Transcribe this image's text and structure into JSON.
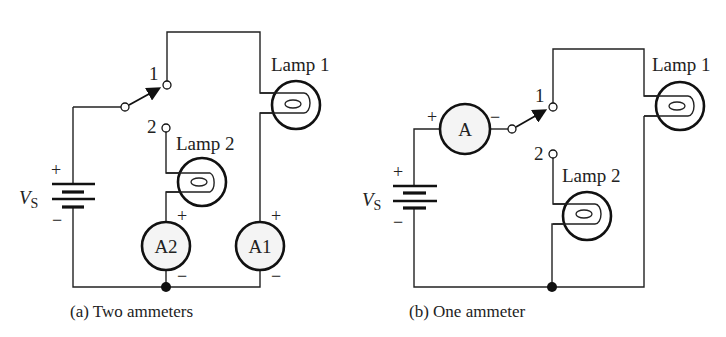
{
  "figures": [
    {
      "id": "a",
      "caption": "(a) Two ammeters",
      "source_label": "V",
      "source_sub": "S",
      "source_plus": "+",
      "source_minus": "−",
      "switch_pos1": "1",
      "switch_pos2": "2",
      "lamp1": "Lamp 1",
      "lamp2": "Lamp 2",
      "ammeter1": "A1",
      "ammeter2": "A2",
      "plus": "+",
      "minus": "−"
    },
    {
      "id": "b",
      "caption": "(b) One ammeter",
      "source_label": "V",
      "source_sub": "S",
      "source_plus": "+",
      "source_minus": "−",
      "switch_pos1": "1",
      "switch_pos2": "2",
      "lamp1": "Lamp 1",
      "lamp2": "Lamp 2",
      "ammeter": "A",
      "plus": "+",
      "minus": "−"
    }
  ]
}
